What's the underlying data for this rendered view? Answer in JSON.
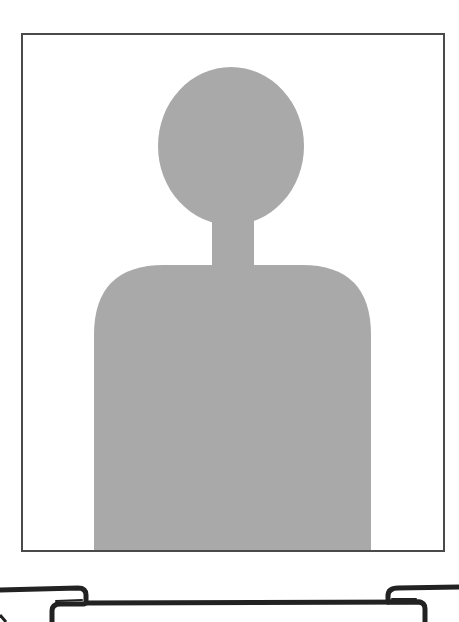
{
  "image": {
    "alt_text": "Placeholder profile photo silhouette",
    "frame": {
      "border_color": "#4a4a4a",
      "background": "#ffffff"
    },
    "silhouette": {
      "fill_color": "#a9a9a9",
      "icon": "person-silhouette-icon"
    }
  },
  "bottom_graphic": {
    "description": "Folder tab outline",
    "stroke_color": "#222222",
    "icon": "folder-tab-outline-icon"
  }
}
